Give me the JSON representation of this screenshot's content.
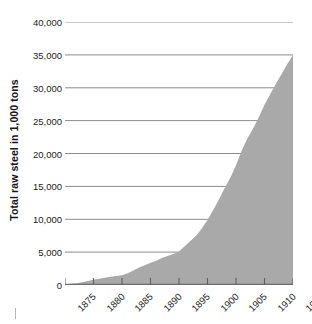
{
  "chart_data": {
    "type": "area",
    "title": "",
    "subtitle": "",
    "xlabel": "",
    "ylabel": "Total raw steel in 1,000 tons",
    "legend": [],
    "grid": true,
    "xlim": [
      1875,
      1915
    ],
    "ylim": [
      0,
      40000
    ],
    "x_tick_labels": [
      "1875",
      "1880",
      "1885",
      "1890",
      "1895",
      "1900",
      "1905",
      "1910",
      "1915"
    ],
    "y_tick_labels": [
      "0",
      "5,000",
      "10,000",
      "15,000",
      "20,000",
      "25,000",
      "30,000",
      "35,000",
      "40,000"
    ],
    "x_ticks": [
      1875,
      1880,
      1885,
      1890,
      1895,
      1900,
      1905,
      1910,
      1915
    ],
    "y_ticks": [
      0,
      5000,
      10000,
      15000,
      20000,
      25000,
      30000,
      35000,
      40000
    ],
    "series": [
      {
        "name": "Total raw steel",
        "fill_color": "#a9a9a9",
        "x": [
          1875,
          1876,
          1877,
          1878,
          1879,
          1880,
          1881,
          1882,
          1883,
          1884,
          1885,
          1886,
          1887,
          1888,
          1889,
          1890,
          1891,
          1892,
          1893,
          1894,
          1895,
          1896,
          1897,
          1898,
          1899,
          1900,
          1901,
          1902,
          1903,
          1904,
          1905,
          1906,
          1907,
          1908,
          1909,
          1910,
          1911,
          1912,
          1913,
          1914,
          1915
        ],
        "values": [
          100,
          180,
          280,
          420,
          620,
          800,
          950,
          1100,
          1250,
          1350,
          1500,
          1800,
          2200,
          2650,
          3000,
          3400,
          3700,
          4100,
          4400,
          4700,
          5100,
          5900,
          6700,
          7500,
          8600,
          9900,
          11400,
          13000,
          14700,
          16300,
          18200,
          20400,
          22300,
          23800,
          25500,
          27400,
          29000,
          30600,
          32100,
          33600,
          35000
        ]
      }
    ]
  },
  "axes": {
    "y_title": "Total raw steel in 1,000 tons",
    "y_labels": [
      "40,000",
      "35,000",
      "30,000",
      "25,000",
      "20,000",
      "15,000",
      "10,000",
      "5,000",
      "0"
    ],
    "x_labels": [
      "1875",
      "1880",
      "1885",
      "1890",
      "1895",
      "1900",
      "1905",
      "1910",
      "1915"
    ]
  },
  "colors": {
    "area_fill": "#a9a9a9",
    "gridline": "#8c8c8c",
    "gridline_light": "#c9c9c9",
    "axis": "#6e6e6e",
    "text": "#1a1a1a",
    "background": "#ffffff"
  }
}
